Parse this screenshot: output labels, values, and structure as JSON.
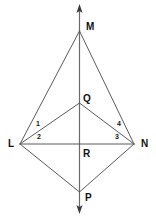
{
  "figure": {
    "background_color": "#ffffff",
    "line_color": "#5a5a5a",
    "label_color": "#111111",
    "width": 156,
    "height": 220
  },
  "vertices": {
    "M": {
      "label": "M",
      "x": 79.5,
      "y": 31,
      "label_x": 86,
      "label_y": 22
    },
    "Q": {
      "label": "Q",
      "x": 79.5,
      "y": 103,
      "label_x": 83,
      "label_y": 94
    },
    "L": {
      "label": "L",
      "x": 20,
      "y": 144,
      "label_x": 8,
      "label_y": 139
    },
    "N": {
      "label": "N",
      "x": 134,
      "y": 144,
      "label_x": 141,
      "label_y": 139
    },
    "R": {
      "label": "R",
      "x": 79.5,
      "y": 144,
      "label_x": 83,
      "label_y": 149
    },
    "P": {
      "label": "P",
      "x": 79.5,
      "y": 192,
      "label_x": 85,
      "label_y": 193
    }
  },
  "angles": [
    {
      "label": "1",
      "x": 36,
      "y": 120
    },
    {
      "label": "2",
      "x": 37,
      "y": 133
    },
    {
      "label": "3",
      "x": 115,
      "y": 133
    },
    {
      "label": "4",
      "x": 117,
      "y": 120
    }
  ],
  "segments": [
    {
      "name": "segment-ML",
      "from": "M",
      "to": "L"
    },
    {
      "name": "segment-MN",
      "from": "M",
      "to": "N"
    },
    {
      "name": "segment-QL",
      "from": "Q",
      "to": "L"
    },
    {
      "name": "segment-QN",
      "from": "Q",
      "to": "N"
    },
    {
      "name": "segment-LN",
      "from": "L",
      "to": "N"
    },
    {
      "name": "segment-LP",
      "from": "L",
      "to": "P"
    },
    {
      "name": "segment-NP",
      "from": "N",
      "to": "P"
    }
  ],
  "axis": {
    "name": "vertical-ray-MP",
    "x": 79.5,
    "top_y": 5,
    "bottom_y": 213,
    "arrow_top": "up-arrow",
    "arrow_bottom": "down-arrow"
  }
}
